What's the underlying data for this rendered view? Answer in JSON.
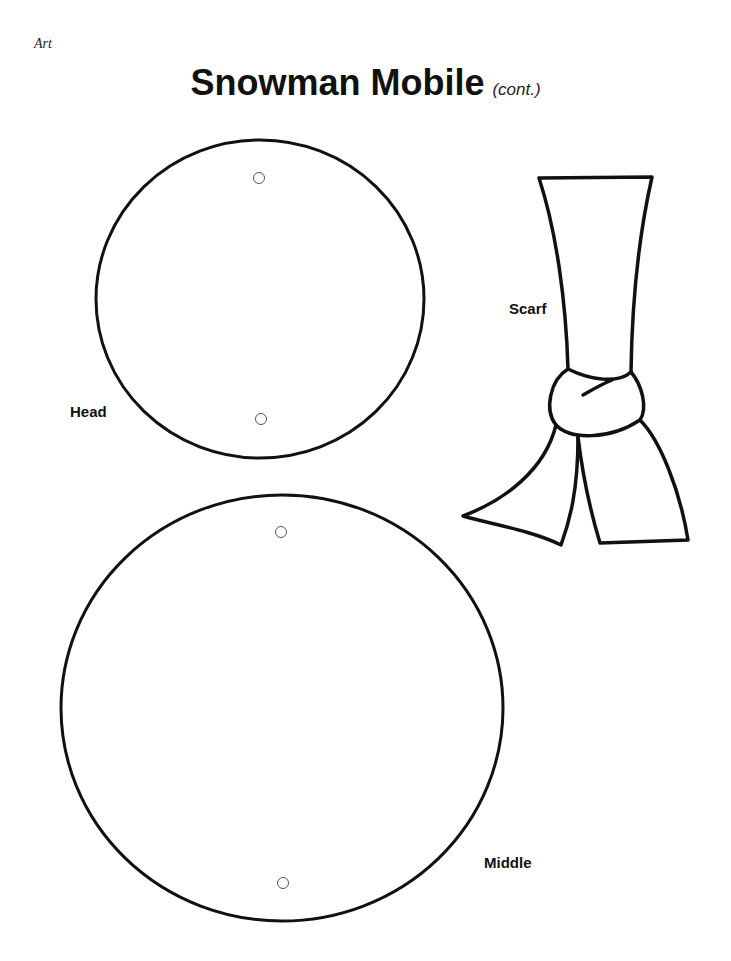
{
  "page": {
    "section_label": "Art",
    "title": "Snowman Mobile",
    "subtitle": "(cont.)"
  },
  "pieces": {
    "head": {
      "label": "Head",
      "shape": "circle-with-two-punch-holes"
    },
    "scarf": {
      "label": "Scarf",
      "shape": "knotted-scarf-outline"
    },
    "middle": {
      "label": "Middle",
      "shape": "circle-with-two-punch-holes"
    }
  },
  "colors": {
    "ink": "#111111",
    "paper": "#ffffff"
  }
}
